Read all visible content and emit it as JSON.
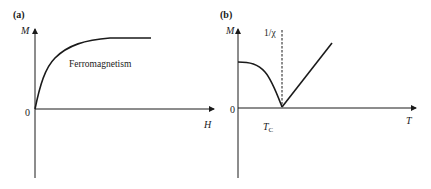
{
  "panels": [
    {
      "id": "a",
      "label": "(a)",
      "y_axis_label": "M",
      "x_axis_label": "H",
      "origin_label": "0",
      "annotation": "Ferromagnetism",
      "curve_description": "magnetization saturating with field"
    },
    {
      "id": "b",
      "label": "(b)",
      "y_axis_label": "M",
      "x_axis_label": "T",
      "origin_label": "0",
      "tc_label_main": "T",
      "tc_label_sub": "C",
      "inverse_susceptibility_label": "1/χ",
      "curve_description": "M decreases to zero at Tc; 1/χ rises linearly above Tc"
    }
  ],
  "colors": {
    "line": "#1a1a1a",
    "background": "#ffffff"
  }
}
